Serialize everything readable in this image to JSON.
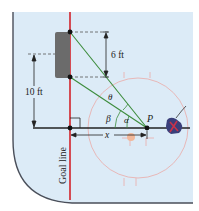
{
  "diagram": {
    "title": "",
    "labels": {
      "six_ft": "6 ft",
      "ten_ft": "10 ft",
      "x": "x",
      "theta": "θ",
      "alpha": "α",
      "beta": "β",
      "point_p": "P",
      "goal_line": "Goal line"
    },
    "colors": {
      "rink_fill": "#dcebf7",
      "boards": "#4a4f5a",
      "goal_line": "#d2232a",
      "goal_box": "#6b6b6b",
      "sight_lines": "#3c8c3c",
      "dashed": "#555555",
      "faceoff_circle": "#e8b8b8",
      "puck_line": "#222222",
      "player": "#3a3f7a"
    }
  }
}
